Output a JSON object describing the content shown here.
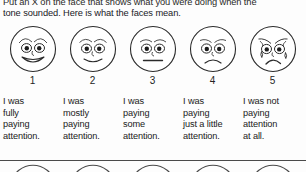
{
  "document": {
    "type": "printed-survey-form",
    "title": "Attention Faces Rating Scale",
    "background_color": "#fdfdfd",
    "ink_color": "#202020"
  },
  "instructions": {
    "line1": "Put an X on the face that shows what you were doing when the",
    "line2": "tone sounded. Here is what the faces mean.",
    "clipped_top": true
  },
  "scale": {
    "count": 5,
    "items": [
      {
        "number": "1",
        "face": "very-happy-face-icon",
        "expression": "big open smile, raised arched eyebrows",
        "mouth": "wide-smile",
        "tears": false,
        "caption_lines": [
          "I was",
          "fully",
          "paying",
          "attention."
        ],
        "caption_text": "I was fully paying attention."
      },
      {
        "number": "2",
        "face": "happy-face-icon",
        "expression": "slight smile, arched eyebrows",
        "mouth": "small-smile",
        "tears": false,
        "caption_lines": [
          "I was",
          "mostly",
          "paying",
          "attention."
        ],
        "caption_text": "I was mostly paying attention."
      },
      {
        "number": "3",
        "face": "neutral-face-icon",
        "expression": "flat straight mouth, neutral brows",
        "mouth": "flat-line",
        "tears": false,
        "caption_lines": [
          "I was",
          "paying",
          "some",
          "attention."
        ],
        "caption_text": "I was paying some attention."
      },
      {
        "number": "4",
        "face": "sad-face-icon",
        "expression": "downturned frown, lowered brows",
        "mouth": "frown",
        "tears": false,
        "caption_lines": [
          "I was",
          "paying",
          "just a little",
          "attention."
        ],
        "caption_text": "I was paying just a little attention."
      },
      {
        "number": "5",
        "face": "crying-face-icon",
        "expression": "deep frown, furrowed brows, tears on both cheeks",
        "mouth": "deep-frown",
        "tears": true,
        "caption_lines": [
          "I was not",
          "paying",
          "attention",
          "at all."
        ],
        "caption_text": "I was not paying attention at all."
      }
    ]
  },
  "next_row": {
    "visible": "clipped-tops-only",
    "count": 5,
    "description": "tops of five more faces from the following question, cut off by page edge"
  }
}
